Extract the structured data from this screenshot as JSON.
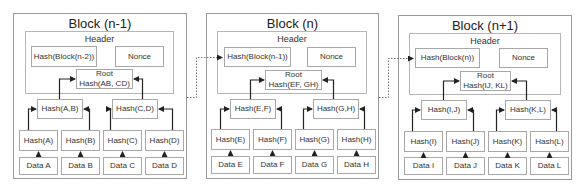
{
  "blocks": [
    {
      "title": "Block (n-1)",
      "header_label": "Header",
      "prev_hash": "Hash(Block(n-2))",
      "nonce": "Nonce",
      "root_line1": "Root",
      "root_line2": "Hash(AB, CD)",
      "pair_hashes": [
        "Hash(A,B)",
        "Hash(C,D)"
      ],
      "leaf_hashes": [
        "Hash(A)",
        "Hash(B)",
        "Hash(C)",
        "Hash(D)"
      ],
      "data": [
        "Data A",
        "Data B",
        "Data C",
        "Data D"
      ]
    },
    {
      "title": "Block (n)",
      "header_label": "Header",
      "prev_hash": "Hash(Block(n-1))",
      "nonce": "Nonce",
      "root_line1": "Root",
      "root_line2": "Hash(EF, GH)",
      "pair_hashes": [
        "Hash(E,F)",
        "Hash(G,H)"
      ],
      "leaf_hashes": [
        "Hash(E)",
        "Hash(F)",
        "Hash(G)",
        "Hash(H)"
      ],
      "data": [
        "Data E",
        "Data F",
        "Data G",
        "Data H"
      ]
    },
    {
      "title": "Block (n+1)",
      "header_label": "Header",
      "prev_hash": "Hash(Block(n))",
      "nonce": "Nonce",
      "root_line1": "Root",
      "root_line2": "Hash(IJ, KL)",
      "pair_hashes": [
        "Hash(I,J)",
        "Hash(K,L)"
      ],
      "leaf_hashes": [
        "Hash(I)",
        "Hash(J)",
        "Hash(K)",
        "Hash(L)"
      ],
      "data": [
        "Data I",
        "Data J",
        "Data K",
        "Data L"
      ]
    }
  ],
  "colors": {
    "frame_border": "#9a9a9a",
    "box_border": "#a8a8a8",
    "arrow": "#222222",
    "dotted_link": "#888888"
  }
}
